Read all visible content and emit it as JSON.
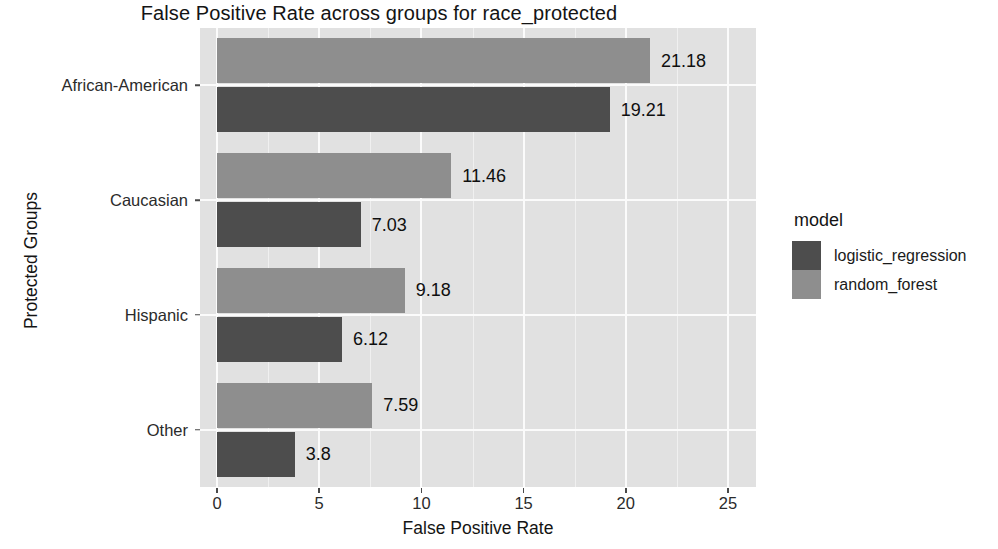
{
  "chart_data": {
    "type": "bar",
    "orientation": "horizontal",
    "title": "False Positive Rate across groups for race_protected",
    "xlabel": "False Positive Rate",
    "ylabel": "Protected Groups",
    "categories": [
      "African-American",
      "Caucasian",
      "Hispanic",
      "Other"
    ],
    "series": [
      {
        "name": "logistic_regression",
        "color": "#4d4d4d",
        "values": [
          19.21,
          7.03,
          6.12,
          3.8
        ],
        "labels": [
          "19.21",
          "7.03",
          "6.12",
          "3.8"
        ]
      },
      {
        "name": "random_forest",
        "color": "#8e8e8e",
        "values": [
          21.18,
          11.46,
          9.18,
          7.59
        ],
        "labels": [
          "21.18",
          "11.46",
          "9.18",
          "7.59"
        ]
      }
    ],
    "xticks": [
      0,
      5,
      10,
      15,
      20,
      25
    ],
    "xtick_labels": [
      "0",
      "5",
      "10",
      "15",
      "20",
      "25"
    ],
    "xlim": [
      -0.85,
      26.4
    ],
    "grid": true,
    "grid_color": "#fbfbfb",
    "panel_background": "#e1e1e1",
    "legend": {
      "title": "model",
      "position": "right",
      "entries": [
        {
          "label": "logistic_regression",
          "color": "#4d4d4d"
        },
        {
          "label": "random_forest",
          "color": "#8e8e8e"
        }
      ]
    }
  }
}
